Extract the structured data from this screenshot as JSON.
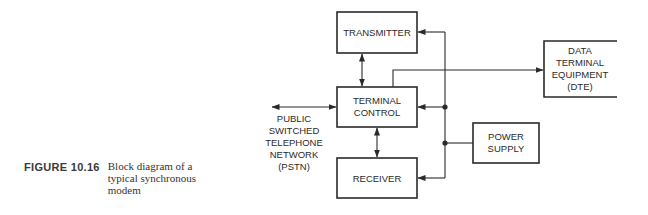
{
  "figure": {
    "number": "FIGURE 10.16",
    "caption_lines": [
      "Block diagram of a",
      "typical synchronous",
      "modem"
    ]
  },
  "blocks": {
    "transmitter": {
      "lines": [
        "TRANSMITTER"
      ]
    },
    "terminal_control": {
      "lines": [
        "TERMINAL",
        "CONTROL"
      ]
    },
    "receiver": {
      "lines": [
        "RECEIVER"
      ]
    },
    "dte": {
      "lines": [
        "DATA",
        "TERMINAL",
        "EQUIPMENT",
        "(DTE)"
      ]
    },
    "power_supply": {
      "lines": [
        "POWER",
        "SUPPLY"
      ]
    }
  },
  "labels": {
    "pstn": {
      "lines": [
        "PUBLIC",
        "SWITCHED",
        "TELEPHONE",
        "NETWORK",
        "(PSTN)"
      ]
    }
  },
  "connections": [
    {
      "from": "pstn",
      "to": "terminal_control",
      "type": "bidirectional"
    },
    {
      "from": "transmitter",
      "to": "terminal_control",
      "type": "bidirectional"
    },
    {
      "from": "terminal_control",
      "to": "receiver",
      "type": "bidirectional"
    },
    {
      "from": "terminal_control",
      "to": "dte",
      "type": "directed"
    },
    {
      "from": "power_supply",
      "to": "transmitter",
      "type": "directed"
    },
    {
      "from": "power_supply",
      "to": "terminal_control",
      "type": "directed"
    },
    {
      "from": "power_supply",
      "to": "receiver",
      "type": "directed"
    }
  ],
  "colors": {
    "line": "#2a2a2a",
    "background": "#ffffff"
  }
}
